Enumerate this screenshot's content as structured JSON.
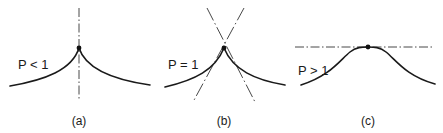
{
  "figure": {
    "panels": [
      {
        "id": "a",
        "caption": "(a)",
        "condition_label": "P < 1",
        "description": "cusp with vertical tangent line",
        "tangent_style": "dash-dot vertical"
      },
      {
        "id": "b",
        "caption": "(b)",
        "condition_label": "P = 1",
        "description": "corner point with two crossing tangent lines",
        "tangent_style": "dashed crossing"
      },
      {
        "id": "c",
        "caption": "(c)",
        "condition_label": "P > 1",
        "description": "smooth peak with horizontal tangent line",
        "tangent_style": "dash-dot horizontal"
      }
    ]
  }
}
